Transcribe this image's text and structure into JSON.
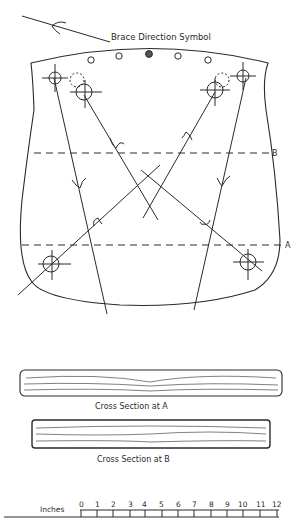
{
  "diagram": {
    "title_label": "Brace Direction Symbol",
    "cut_lines": [
      {
        "label": "B",
        "y": 153
      },
      {
        "label": "A",
        "y": 245
      }
    ],
    "cross_sections": [
      {
        "label": "Cross Section at A"
      },
      {
        "label": "Cross Section at B"
      }
    ],
    "scale": {
      "unit_label": "Inches",
      "ticks": [
        "0",
        "1",
        "2",
        "3",
        "4",
        "5",
        "6",
        "7",
        "8",
        "9",
        "10",
        "11",
        "12"
      ]
    },
    "colors": {
      "ink": "#2a2a2a",
      "background": "#ffffff"
    }
  }
}
